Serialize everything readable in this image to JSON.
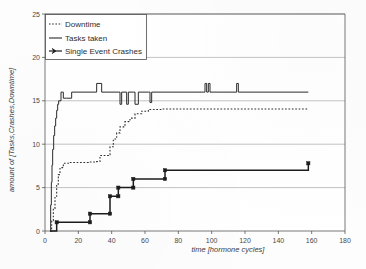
{
  "chart_data": {
    "type": "line",
    "title": "",
    "xlabel": "time [hormone cycles]",
    "ylabel": "amount of [Tasks,Crashes,Downtime]",
    "xlim": [
      0,
      180
    ],
    "ylim": [
      0,
      25
    ],
    "xticks": [
      0,
      20,
      40,
      60,
      80,
      100,
      120,
      140,
      160,
      180
    ],
    "yticks": [
      0,
      5,
      10,
      15,
      20,
      25
    ],
    "grid": "horizontal",
    "legend_position": "top-left",
    "series": [
      {
        "name": "Downtime",
        "style": "dotted",
        "color": "#303030",
        "points": [
          [
            3,
            0
          ],
          [
            4,
            1.2
          ],
          [
            5,
            2.6
          ],
          [
            6,
            4.0
          ],
          [
            7,
            5.4
          ],
          [
            8,
            6.5
          ],
          [
            9,
            7.3
          ],
          [
            11,
            7.8
          ],
          [
            14,
            7.9
          ],
          [
            20,
            7.9
          ],
          [
            26,
            7.95
          ],
          [
            31,
            8.0
          ],
          [
            33,
            8.7
          ],
          [
            38,
            8.8
          ],
          [
            39,
            9.7
          ],
          [
            41,
            10.6
          ],
          [
            43,
            11.3
          ],
          [
            45,
            12.0
          ],
          [
            48,
            12.6
          ],
          [
            51,
            13.0
          ],
          [
            54,
            13.5
          ],
          [
            58,
            13.8
          ],
          [
            62,
            14.0
          ],
          [
            70,
            14.05
          ],
          [
            90,
            14.05
          ],
          [
            110,
            14.05
          ],
          [
            130,
            14.05
          ],
          [
            158,
            14.05
          ]
        ]
      },
      {
        "name": "Tasks taken",
        "style": "solid-thin",
        "color": "#2b2b2b",
        "points": [
          [
            3,
            0
          ],
          [
            3.4,
            3.0
          ],
          [
            3.8,
            5.6
          ],
          [
            4.2,
            7.6
          ],
          [
            4.6,
            9.4
          ],
          [
            5.2,
            11.0
          ],
          [
            5.8,
            12.1
          ],
          [
            6.4,
            13.0
          ],
          [
            7.0,
            13.9
          ],
          [
            7.6,
            14.6
          ],
          [
            8.2,
            15.0
          ],
          [
            9.0,
            15.0
          ],
          [
            9.6,
            16.0
          ],
          [
            10.4,
            16.0
          ],
          [
            11.0,
            15.3
          ],
          [
            13,
            15.3
          ],
          [
            16,
            16.0
          ],
          [
            30,
            16.0
          ],
          [
            31,
            17.0
          ],
          [
            33,
            17.0
          ],
          [
            34,
            16.0
          ],
          [
            44,
            16.0
          ],
          [
            45,
            14.6
          ],
          [
            46,
            16.0
          ],
          [
            48,
            16.0
          ],
          [
            49,
            14.6
          ],
          [
            50,
            16.0
          ],
          [
            53,
            16.0
          ],
          [
            54,
            14.6
          ],
          [
            56,
            16.0
          ],
          [
            62,
            16.0
          ],
          [
            63,
            14.8
          ],
          [
            64,
            16.0
          ],
          [
            95,
            16.0
          ],
          [
            96,
            17.0
          ],
          [
            97,
            16.0
          ],
          [
            98,
            17.0
          ],
          [
            99,
            16.0
          ],
          [
            114,
            16.0
          ],
          [
            115,
            17.0
          ],
          [
            116,
            16.0
          ],
          [
            158,
            16.0
          ]
        ]
      },
      {
        "name": "Single Event Crashes",
        "style": "solid-thick-markers",
        "color": "#1c1c1c",
        "points": [
          [
            3,
            0
          ],
          [
            7,
            0
          ],
          [
            7,
            1
          ],
          [
            27,
            1
          ],
          [
            27,
            2
          ],
          [
            39,
            2
          ],
          [
            39,
            4
          ],
          [
            44,
            4
          ],
          [
            44,
            5
          ],
          [
            53,
            5
          ],
          [
            53,
            6
          ],
          [
            72,
            6
          ],
          [
            72,
            7
          ],
          [
            158,
            7
          ],
          [
            158,
            7.8
          ]
        ],
        "markers": [
          [
            7,
            1
          ],
          [
            27,
            1
          ],
          [
            27,
            2
          ],
          [
            39,
            2
          ],
          [
            39,
            4
          ],
          [
            44,
            4
          ],
          [
            44,
            5
          ],
          [
            53,
            5
          ],
          [
            53,
            6
          ],
          [
            72,
            6
          ],
          [
            72,
            7
          ],
          [
            158,
            7.8
          ]
        ]
      }
    ]
  },
  "legend": {
    "items": [
      {
        "label": "Downtime",
        "marker": "dotted-line"
      },
      {
        "label": "Tasks taken",
        "marker": "solid-line"
      },
      {
        "label": "Single Event Crashes",
        "marker": "line-with-cross-marker"
      }
    ]
  },
  "axes": {
    "x_tick_labels": [
      "0",
      "20",
      "40",
      "60",
      "80",
      "100",
      "120",
      "140",
      "160",
      "180"
    ],
    "y_tick_labels": [
      "0",
      "5",
      "10",
      "15",
      "20",
      "25"
    ],
    "x_title": "time [hormone cycles]",
    "y_title": "amount of [Tasks,Crashes,Downtime]"
  }
}
